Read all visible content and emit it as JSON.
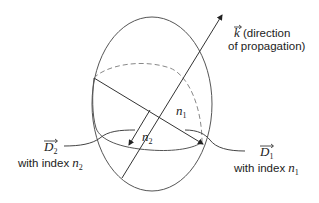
{
  "diagram": {
    "type": "index-ellipsoid",
    "colors": {
      "stroke": "#555555",
      "dashed": "#888888",
      "arrow": "#333333",
      "text": "#222222"
    },
    "labels": {
      "k_vector": {
        "symbol": "k",
        "text_line1": "(direction",
        "text_line2": "of propagation)"
      },
      "n1_axis": {
        "symbol": "n",
        "subscript": "1"
      },
      "n2_axis": {
        "symbol": "n",
        "subscript": "2"
      },
      "d1_vector": {
        "symbol": "D",
        "subscript": "1",
        "caption": "with index",
        "index_symbol": "n",
        "index_subscript": "1"
      },
      "d2_vector": {
        "symbol": "D",
        "subscript": "2",
        "caption": "with index",
        "index_symbol": "n",
        "index_subscript": "2"
      }
    }
  }
}
